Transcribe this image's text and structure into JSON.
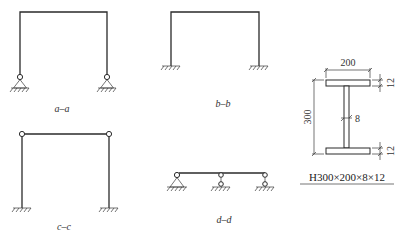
{
  "frames": [
    {
      "id": "a-a",
      "label": "a–a",
      "supports": "pinned",
      "top_joints": "rigid"
    },
    {
      "id": "b-b",
      "label": "b–b",
      "supports": "fixed",
      "top_joints": "rigid"
    },
    {
      "id": "c-c",
      "label": "c–c",
      "supports": "fixed",
      "top_joints": "hinged"
    },
    {
      "id": "d-d",
      "label": "d–d",
      "supports": "pinned-and-link",
      "top_joints": "hinged"
    }
  ],
  "section": {
    "flange_width": "200",
    "height": "300",
    "web_thickness": "8",
    "top_flange_thickness": "12",
    "bottom_flange_thickness": "12",
    "designation": "H300×200×8×12"
  }
}
